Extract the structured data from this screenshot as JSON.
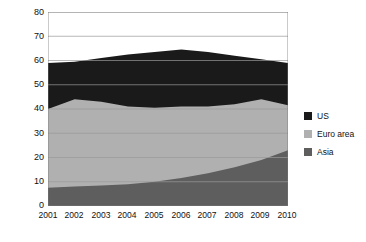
{
  "chart_data": {
    "type": "area",
    "stacked": true,
    "title": "",
    "subtitle": "",
    "xlabel": "",
    "ylabel": "% Africa Exports",
    "categories": [
      "2001",
      "2002",
      "2003",
      "2004",
      "2005",
      "2006",
      "2007",
      "2008",
      "2009",
      "2010"
    ],
    "x": [
      2001,
      2002,
      2003,
      2004,
      2005,
      2006,
      2007,
      2008,
      2009,
      2010
    ],
    "series": [
      {
        "name": "Asia",
        "color": "#5e5e5e",
        "values": [
          7.5,
          8.0,
          8.5,
          9.0,
          10.0,
          11.5,
          13.5,
          16.0,
          19.0,
          23.0
        ]
      },
      {
        "name": "Euro area",
        "color": "#b0b0b0",
        "values": [
          32.5,
          36.0,
          34.5,
          32.0,
          30.5,
          29.5,
          27.5,
          26.0,
          25.0,
          18.5
        ]
      },
      {
        "name": "US",
        "color": "#1a1a1a",
        "values": [
          19.0,
          15.5,
          18.0,
          21.5,
          23.0,
          23.5,
          22.5,
          20.0,
          16.5,
          17.5
        ]
      }
    ],
    "cumulative_tops": {
      "asia": [
        7.5,
        8.0,
        8.5,
        9.0,
        10.0,
        11.5,
        13.5,
        16.0,
        19.0,
        23.0
      ],
      "asia_plus_euro": [
        40.0,
        44.0,
        43.0,
        41.0,
        40.5,
        41.0,
        41.0,
        42.0,
        44.0,
        41.5
      ],
      "total": [
        59.0,
        59.5,
        61.0,
        62.5,
        63.5,
        64.5,
        63.5,
        62.0,
        60.5,
        59.0
      ]
    },
    "ylim": [
      0,
      80
    ],
    "yticks": [
      0,
      10,
      20,
      30,
      40,
      50,
      60,
      70,
      80
    ],
    "ytick_labels": [
      "0",
      "10",
      "20",
      "30",
      "40",
      "50",
      "60",
      "70",
      "80"
    ],
    "grid": true,
    "grid_color": "#9a9a9a",
    "legend_position": "right",
    "legend": [
      {
        "label": "US",
        "color": "#1a1a1a"
      },
      {
        "label": "Euro area",
        "color": "#b0b0b0"
      },
      {
        "label": "Asia",
        "color": "#5e5e5e"
      }
    ],
    "background": "#ffffff"
  }
}
